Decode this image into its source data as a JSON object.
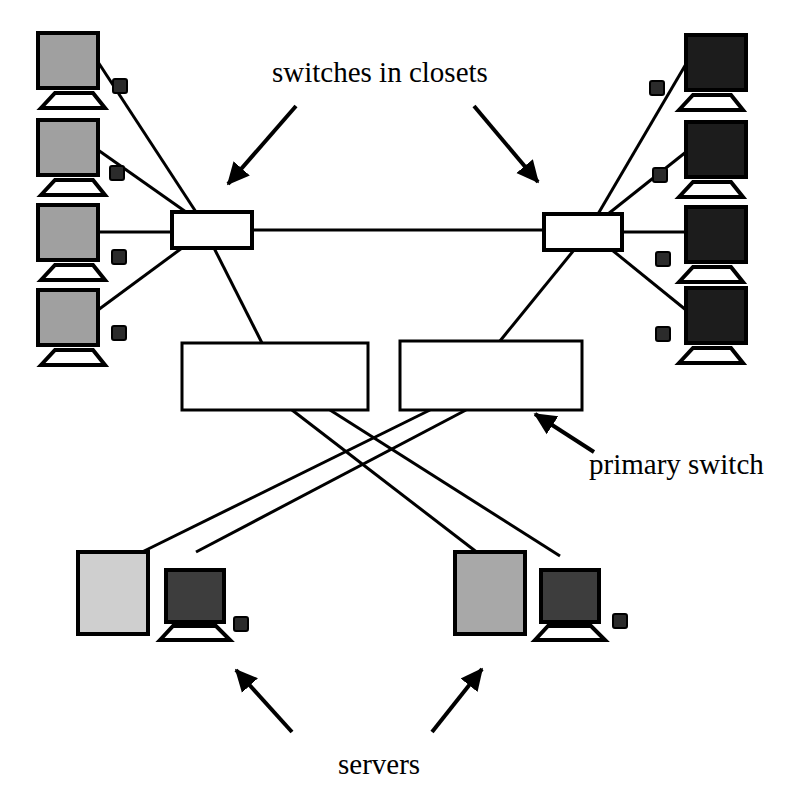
{
  "diagram": {
    "background_color": "#ffffff",
    "line_color": "#000000",
    "labels": {
      "switches_in_closets": "switches in closets",
      "primary_switch": "primary switch",
      "servers": "servers"
    },
    "colors": {
      "stroke": "#000000",
      "switch_fill": "#ffffff",
      "left_monitor_screen": "#a0a0a0",
      "right_monitor_screen": "#1c1c1c",
      "server_tower_left": "#cfcfcf",
      "server_tower_right": "#a8a8a8",
      "server_monitor_screen": "#3d3d3d",
      "node_box": "#2b2b2b",
      "stand_fill": "#ffffff"
    },
    "left_workstations": [
      {
        "name": "left-workstation-1",
        "screen_x": 38,
        "screen_y": 33,
        "screen_w": 60,
        "screen_h": 55,
        "shade": "#a0a0a0"
      },
      {
        "name": "left-workstation-2",
        "screen_x": 38,
        "screen_y": 120,
        "screen_w": 60,
        "screen_h": 55,
        "shade": "#a0a0a0"
      },
      {
        "name": "left-workstation-3",
        "screen_x": 38,
        "screen_y": 205,
        "screen_w": 60,
        "screen_h": 55,
        "shade": "#a0a0a0"
      },
      {
        "name": "left-workstation-4",
        "screen_x": 38,
        "screen_y": 290,
        "screen_w": 60,
        "screen_h": 55,
        "shade": "#a0a0a0"
      }
    ],
    "right_workstations": [
      {
        "name": "right-workstation-1",
        "screen_x": 686,
        "screen_y": 35,
        "screen_w": 60,
        "screen_h": 55,
        "shade": "#1c1c1c"
      },
      {
        "name": "right-workstation-2",
        "screen_x": 686,
        "screen_y": 122,
        "screen_w": 60,
        "screen_h": 55,
        "shade": "#1c1c1c"
      },
      {
        "name": "right-workstation-3",
        "screen_x": 686,
        "screen_y": 207,
        "screen_w": 60,
        "screen_h": 55,
        "shade": "#1c1c1c"
      },
      {
        "name": "right-workstation-4",
        "screen_x": 686,
        "screen_y": 288,
        "screen_w": 60,
        "screen_h": 55,
        "shade": "#1c1c1c"
      }
    ],
    "closet_switches": [
      {
        "name": "closet-switch-left",
        "x": 172,
        "y": 212,
        "w": 80,
        "h": 36
      },
      {
        "name": "closet-switch-right",
        "x": 544,
        "y": 214,
        "w": 78,
        "h": 36
      }
    ],
    "primary_switches": [
      {
        "name": "primary-switch-left",
        "x": 182,
        "y": 343,
        "w": 186,
        "h": 67
      },
      {
        "name": "primary-switch-right",
        "x": 400,
        "y": 341,
        "w": 182,
        "h": 69
      }
    ],
    "servers": [
      {
        "name": "server-left",
        "tower_x": 78,
        "tower_y": 552,
        "tower_w": 70,
        "tower_h": 82,
        "monitor_x": 166,
        "monitor_y": 570,
        "monitor_w": 58,
        "monitor_h": 52
      },
      {
        "name": "server-right",
        "tower_x": 455,
        "tower_y": 552,
        "tower_w": 70,
        "tower_h": 82,
        "monitor_x": 541,
        "monitor_y": 570,
        "monitor_w": 58,
        "monitor_h": 52
      }
    ],
    "annotation_arrows": [
      {
        "name": "arrow-to-left-closet-switch",
        "x1": 296,
        "y1": 108,
        "x2": 224,
        "y2": 190
      },
      {
        "name": "arrow-to-right-closet-switch",
        "x1": 474,
        "y1": 108,
        "x2": 542,
        "y2": 188
      },
      {
        "name": "arrow-to-primary-switch",
        "x1": 592,
        "y1": 450,
        "x2": 531,
        "y2": 411
      },
      {
        "name": "arrow-to-left-server",
        "x1": 290,
        "y1": 730,
        "x2": 232,
        "y2": 664
      },
      {
        "name": "arrow-to-right-server",
        "x1": 434,
        "y1": 730,
        "x2": 486,
        "y2": 663
      }
    ],
    "inline_nodes": [
      {
        "name": "cable-node-left-1",
        "x": 120,
        "y": 86
      },
      {
        "name": "cable-node-left-2",
        "x": 117,
        "y": 173
      },
      {
        "name": "cable-node-left-3",
        "x": 119,
        "y": 257
      },
      {
        "name": "cable-node-left-4",
        "x": 119,
        "y": 333
      },
      {
        "name": "cable-node-right-1",
        "x": 657,
        "y": 88
      },
      {
        "name": "cable-node-right-2",
        "x": 660,
        "y": 175
      },
      {
        "name": "cable-node-right-3",
        "x": 663,
        "y": 259
      },
      {
        "name": "cable-node-right-4",
        "x": 663,
        "y": 334
      },
      {
        "name": "cable-node-server-left",
        "x": 241,
        "y": 624
      },
      {
        "name": "cable-node-server-right",
        "x": 620,
        "y": 621
      }
    ]
  }
}
